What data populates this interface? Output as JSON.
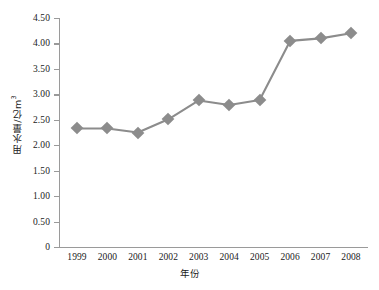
{
  "chart_data": {
    "type": "line",
    "title": "",
    "subtitle": "",
    "xlabel": "年份",
    "ylabel": "用水量/亿m³",
    "ylabel_base": "用水量/亿m",
    "ylabel_exponent": "3",
    "categories": [
      "1999",
      "2000",
      "2001",
      "2002",
      "2003",
      "2004",
      "2005",
      "2006",
      "2007",
      "2008"
    ],
    "x": [
      1999,
      2000,
      2001,
      2002,
      2003,
      2004,
      2005,
      2006,
      2007,
      2008
    ],
    "series": [
      {
        "name": "用水量",
        "values": [
          2.33,
          2.33,
          2.25,
          2.51,
          2.88,
          2.79,
          2.89,
          4.05,
          4.1,
          4.2
        ],
        "color": "#8c8c8c",
        "marker": "diamond"
      }
    ],
    "values": [
      2.33,
      2.33,
      2.25,
      2.51,
      2.88,
      2.79,
      2.89,
      4.05,
      4.1,
      4.2
    ],
    "ylim": [
      0,
      4.5
    ],
    "ytick_values": [
      0,
      0.5,
      1.0,
      1.5,
      2.0,
      2.5,
      3.0,
      3.5,
      4.0,
      4.5
    ],
    "ytick_labels": [
      "0",
      "0.50",
      "1.00",
      "1.50",
      "2.00",
      "2.50",
      "3.00",
      "3.50",
      "4.00",
      "4.50"
    ],
    "xtick_labels": [
      "1999",
      "2000",
      "2001",
      "2002",
      "2003",
      "2004",
      "2005",
      "2006",
      "2007",
      "2008"
    ],
    "grid": false,
    "legend": "none",
    "axis_color": "#9a9a9a",
    "text_color": "#1a1a1a",
    "background": "#ffffff"
  }
}
